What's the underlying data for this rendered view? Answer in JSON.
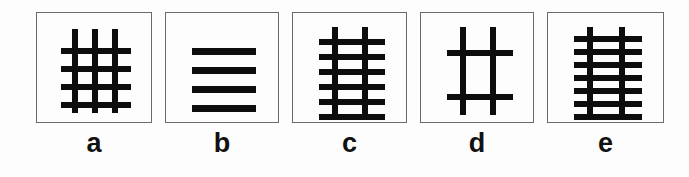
{
  "figure": {
    "background_color": "#fdfdfd",
    "stroke_color": "#0d0d0d",
    "border_color": "#6a6a6a",
    "panel_count": 5
  },
  "panels": [
    {
      "label": "a",
      "name": "panel-a",
      "box": {
        "x": 0,
        "y": 0,
        "width": 116,
        "height": 111
      },
      "vertical_lines": 3,
      "horizontal_lines": 4,
      "line_thickness": 6,
      "vertical_positions": [
        38,
        58,
        78
      ],
      "horizontal_positions": [
        38,
        56,
        74,
        92
      ],
      "vertical_span": {
        "top": 16,
        "bottom": 100
      },
      "horizontal_span": {
        "left": 24,
        "right": 94
      }
    },
    {
      "label": "b",
      "name": "panel-b",
      "box": {
        "x": 127,
        "y": 0,
        "width": 114,
        "height": 111
      },
      "vertical_lines": 0,
      "horizontal_lines": 4,
      "line_thickness": 7,
      "vertical_positions": [],
      "horizontal_positions": [
        38,
        57,
        76,
        95
      ],
      "vertical_span": {
        "top": 0,
        "bottom": 0
      },
      "horizontal_span": {
        "left": 26,
        "right": 90
      }
    },
    {
      "label": "c",
      "name": "panel-c",
      "box": {
        "x": 252,
        "y": 0,
        "width": 115,
        "height": 111
      },
      "vertical_lines": 2,
      "horizontal_lines": 6,
      "line_thickness": 6,
      "vertical_positions": [
        42,
        72
      ],
      "horizontal_positions": [
        29,
        44,
        59,
        74,
        89,
        104
      ],
      "vertical_span": {
        "top": 14,
        "bottom": 104
      },
      "horizontal_span": {
        "left": 26,
        "right": 92
      }
    },
    {
      "label": "d",
      "name": "panel-d",
      "box": {
        "x": 378,
        "y": 0,
        "width": 114,
        "height": 111
      },
      "vertical_lines": 2,
      "horizontal_lines": 2,
      "line_thickness": 6,
      "vertical_positions": [
        42,
        72
      ],
      "horizontal_positions": [
        40,
        84
      ],
      "vertical_span": {
        "top": 14,
        "bottom": 102
      },
      "horizontal_span": {
        "left": 26,
        "right": 92
      }
    },
    {
      "label": "e",
      "name": "panel-e",
      "box": {
        "x": 503,
        "y": 0,
        "width": 117,
        "height": 111
      },
      "vertical_lines": 2,
      "horizontal_lines": 7,
      "line_thickness": 6,
      "vertical_positions": [
        42,
        74
      ],
      "horizontal_positions": [
        26,
        39,
        52,
        65,
        78,
        91,
        104
      ],
      "vertical_span": {
        "top": 14,
        "bottom": 104
      },
      "horizontal_span": {
        "left": 26,
        "right": 94
      }
    }
  ]
}
